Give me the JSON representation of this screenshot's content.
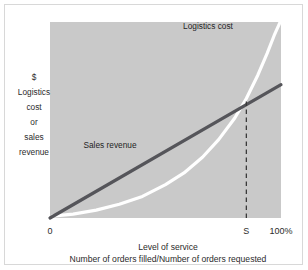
{
  "chart_data": {
    "type": "line",
    "title": "",
    "xlabel": "Level of service",
    "xlabel_sub": "Number of orders filled/Number of orders requested",
    "ylabel_lines": [
      "$",
      "Logistics",
      "cost",
      "or",
      "sales",
      "revenue"
    ],
    "x_ticks": [
      "0",
      "S",
      "100%"
    ],
    "x_tick_positions": [
      0,
      85,
      100
    ],
    "y_ticks": [],
    "grid": false,
    "legend_position": "inline-annotations",
    "xlim": [
      0,
      100
    ],
    "ylim": [
      0,
      100
    ],
    "annotations": [
      {
        "name": "logistics-cost-label",
        "text": "Logistics cost",
        "x": 63,
        "y": 88
      },
      {
        "name": "sales-revenue-label",
        "text": "Sales revenue",
        "x": 25,
        "y": 43
      }
    ],
    "series": [
      {
        "name": "Logistics cost",
        "type": "exponential-curve",
        "color": "#ffffff",
        "style": "solid",
        "x": [
          1,
          10,
          20,
          30,
          40,
          50,
          58,
          66,
          73,
          80,
          85,
          90,
          94,
          97,
          100
        ],
        "y": [
          1,
          2,
          4,
          7,
          11,
          17,
          23,
          31,
          40,
          51,
          61,
          73,
          84,
          93,
          101
        ]
      },
      {
        "name": "Sales revenue",
        "type": "line",
        "color": "#55555a",
        "style": "solid",
        "x": [
          0,
          100
        ],
        "y": [
          0,
          68
        ]
      },
      {
        "name": "Optimum service level marker",
        "type": "vertical-dashed",
        "color": "#3a3a3a",
        "style": "dashed",
        "x": [
          85,
          85
        ],
        "y": [
          0,
          61
        ]
      }
    ],
    "intersection": {
      "x": 85,
      "y": 61,
      "label": "S"
    },
    "plot_background": "#c9c9c9",
    "page_background": "#ffffff"
  }
}
